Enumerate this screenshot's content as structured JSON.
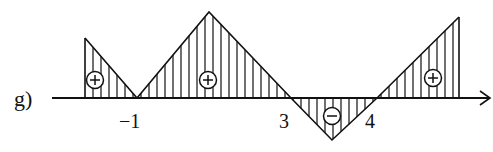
{
  "label": "g)",
  "colors": {
    "ink": "#111111",
    "background": "#ffffff"
  },
  "axis": {
    "y": 98,
    "x_start": 52,
    "x_end": 490,
    "ticks": [
      {
        "value": "−1",
        "x": 137
      },
      {
        "value": "3",
        "x": 291
      },
      {
        "value": "4",
        "x": 377
      }
    ]
  },
  "graph_vertices": [
    {
      "x": 85,
      "y": 38
    },
    {
      "x": 137,
      "y": 98
    },
    {
      "x": 209,
      "y": 12
    },
    {
      "x": 291,
      "y": 98
    },
    {
      "x": 332,
      "y": 140
    },
    {
      "x": 377,
      "y": 98
    },
    {
      "x": 459,
      "y": 17
    }
  ],
  "regions": [
    {
      "sign": "+",
      "symbol_x": 95,
      "symbol_y": 80,
      "x_from": 85,
      "x_to": 137
    },
    {
      "sign": "+",
      "symbol_x": 208,
      "symbol_y": 80,
      "x_from": 137,
      "x_to": 291
    },
    {
      "sign": "−",
      "symbol_x": 332,
      "symbol_y": 116,
      "x_from": 291,
      "x_to": 377
    },
    {
      "sign": "+",
      "symbol_x": 433,
      "symbol_y": 78,
      "x_from": 377,
      "x_to": 459
    }
  ],
  "hatch_spacing": 8
}
